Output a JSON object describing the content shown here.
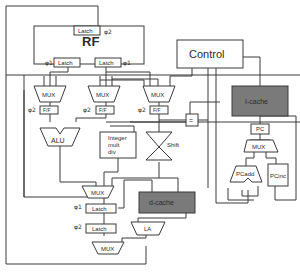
{
  "diagram": {
    "type": "processor-datapath",
    "register_file": {
      "label": "RF",
      "write_latch": {
        "label": "Latch",
        "phase": "φ2"
      },
      "read_latches": [
        {
          "label": "Latch",
          "phase": "φ1"
        },
        {
          "label": "Latch",
          "phase": "φ1"
        }
      ]
    },
    "control": {
      "label": "Control"
    },
    "operand_muxes": [
      {
        "label": "MUX"
      },
      {
        "label": "MUX"
      },
      {
        "label": "MUX"
      }
    ],
    "flipflops": [
      {
        "label": "F/F",
        "phase": "φ2"
      },
      {
        "label": "F/F",
        "phase": "φ2"
      },
      {
        "label": "F/F",
        "phase": "φ2"
      }
    ],
    "alu": {
      "label": "ALU"
    },
    "mult_div": {
      "label_lines": [
        "Integer",
        "mult",
        "div"
      ]
    },
    "shifter": {
      "label": "Shift"
    },
    "comparator": {
      "label": "="
    },
    "result_mux": {
      "label": "MUX"
    },
    "pipeline_latches": [
      {
        "label": "Latch",
        "phase": "φ1"
      },
      {
        "label": "Latch",
        "phase": "φ2"
      }
    ],
    "dcache": {
      "label": "d-cache"
    },
    "load_aligner": {
      "label": "LA"
    },
    "writeback_mux": {
      "label": "MUX"
    },
    "icache": {
      "label": "I-cache"
    },
    "pc": {
      "label": "PC"
    },
    "pc_mux": {
      "label": "MUX"
    },
    "pc_adder": {
      "label": "PCadd"
    },
    "pc_incrementer": {
      "label": "PCinc"
    },
    "colors": {
      "line": "#3a3a3a",
      "cache_fill": "#7a7a7a",
      "background": "#ffffff"
    }
  }
}
